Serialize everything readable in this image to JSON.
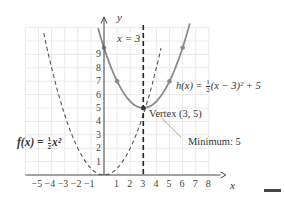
{
  "chart_data": {
    "type": "line",
    "title": "",
    "xlabel": "x",
    "ylabel": "y",
    "xlim": [
      -6,
      8.5
    ],
    "ylim": [
      0,
      11
    ],
    "grid": true,
    "x_ticks": [
      "-5",
      "-4",
      "-3",
      "-2",
      "-1",
      "1",
      "2",
      "3",
      "4",
      "5",
      "6",
      "7",
      "8"
    ],
    "y_ticks": [
      "1",
      "2",
      "3",
      "4",
      "5",
      "6",
      "7",
      "8",
      "9"
    ],
    "series": [
      {
        "name": "f(x) = 1/2 x^2",
        "style": "dashed",
        "color": "#555555",
        "x": [
          -4.6,
          -4,
          -3,
          -2,
          -1,
          0,
          1,
          2,
          3,
          4.3
        ],
        "y": [
          10.6,
          8,
          4.5,
          2,
          0.5,
          0,
          0.5,
          2,
          4.5,
          9.2
        ]
      },
      {
        "name": "h(x) = 1/2 (x - 3)^2 + 5",
        "style": "solid",
        "color": "#888888",
        "x": [
          -0.4,
          0,
          1,
          2,
          3,
          4,
          5,
          6,
          6.5
        ],
        "y": [
          10.8,
          9.5,
          7,
          5.5,
          5,
          5.5,
          7,
          9.5,
          11.1
        ],
        "points": [
          [
            0,
            9.5
          ],
          [
            1,
            7
          ],
          [
            3,
            5
          ],
          [
            5,
            7
          ],
          [
            6,
            9.5
          ]
        ]
      },
      {
        "name": "x = 3",
        "style": "bold-dashed",
        "color": "#222222",
        "x": [
          3,
          3
        ],
        "y": [
          0,
          11
        ]
      }
    ],
    "annotations": [
      {
        "text": "x = 3",
        "x": 3,
        "y": 10.5
      },
      {
        "text": "Vertex (3, 5)",
        "x": 3.1,
        "y": 4.7
      },
      {
        "text": "Minimum: 5",
        "x": 5.5,
        "y": 2.7
      }
    ]
  },
  "labels": {
    "y_axis": "y",
    "x_axis": "x",
    "asymptote": "x = 3",
    "h_prefix": "h(x) = ",
    "h_suffix": "(x − 3)² + 5",
    "f_prefix": "f(x) = ",
    "f_suffix": "x²",
    "frac_num": "1",
    "frac_den": "2",
    "vertex": "Vertex (3, 5)",
    "minimum": "Minimum: 5"
  }
}
